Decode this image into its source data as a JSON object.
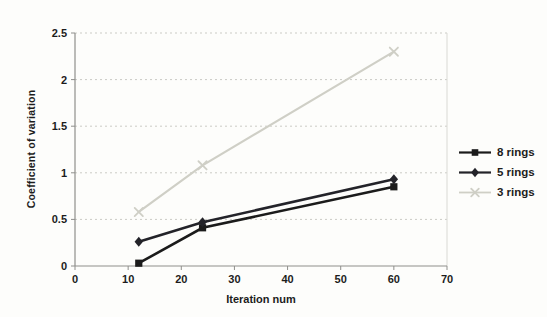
{
  "chart_data": {
    "type": "line",
    "title": "",
    "xlabel": "Iteration num",
    "ylabel": "Coefficient of variation",
    "x": [
      12,
      24,
      60
    ],
    "series": [
      {
        "name": "8 rings",
        "marker": "square",
        "color": "#1b1b1b",
        "line_width": 2.6,
        "values": [
          0.03,
          0.41,
          0.85
        ]
      },
      {
        "name": "5 rings",
        "marker": "diamond",
        "color": "#232329",
        "line_width": 2.6,
        "values": [
          0.26,
          0.47,
          0.93
        ]
      },
      {
        "name": "3 rings",
        "marker": "x",
        "color": "#cfcfc6",
        "line_width": 2.2,
        "values": [
          0.58,
          1.08,
          2.3
        ]
      }
    ],
    "xlim": [
      0,
      70
    ],
    "ylim": [
      0,
      2.5
    ],
    "x_ticks": [
      "0",
      "10",
      "20",
      "30",
      "40",
      "50",
      "60",
      "70"
    ],
    "y_ticks": [
      "0",
      "0.5",
      "1",
      "1.5",
      "2",
      "2.5"
    ],
    "grid": "horizontal-dashed",
    "legend_position": "right"
  },
  "colors": {
    "axis": "#8f8f8c",
    "gridline": "#cbcbc5",
    "plot_border": "#d9d9d4",
    "tick_text": "#1c1c1c"
  }
}
